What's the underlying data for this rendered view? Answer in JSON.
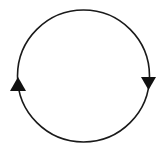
{
  "diagram": {
    "type": "cycle",
    "colors": {
      "background": "#ffffff",
      "stroke": "#1a1a1a",
      "arrow_fill": "#111111"
    },
    "circle": {
      "cx": 83.5,
      "cy": 76,
      "r": 66,
      "stroke_width": 1.6
    },
    "arrows": [
      {
        "position": "left",
        "direction": "up",
        "points": "18,77 10,91 26,91"
      },
      {
        "position": "right",
        "direction": "down",
        "points": "141,77 156,77 148.5,90"
      }
    ]
  }
}
